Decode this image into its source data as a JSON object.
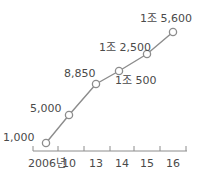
{
  "chart_data": {
    "type": "line",
    "title": "",
    "xlabel": "",
    "ylabel": "",
    "categories": [
      "2006년",
      "10",
      "13",
      "14",
      "15",
      "16"
    ],
    "values": [
      1000,
      5000,
      8850,
      10500,
      12500,
      15600
    ],
    "value_labels": [
      "1,000",
      "5,000",
      "8,850",
      "1조 500",
      "1조 2,500",
      "1조 5,600"
    ],
    "grid": false,
    "legend": null,
    "colors": {
      "line": "#8c8c8c",
      "marker_stroke": "#8c8c8c",
      "marker_fill": "#ffffff",
      "text": "#4a4a4a",
      "axis": "#8c8c8c"
    }
  },
  "layout": {
    "points": [
      {
        "x": 46,
        "y": 143
      },
      {
        "x": 69,
        "y": 115
      },
      {
        "x": 96,
        "y": 84
      },
      {
        "x": 119,
        "y": 71
      },
      {
        "x": 147,
        "y": 54
      },
      {
        "x": 173,
        "y": 32
      }
    ],
    "label_pos": [
      {
        "x": 3,
        "y": 141,
        "anchor": "start"
      },
      {
        "x": 30,
        "y": 112,
        "anchor": "start"
      },
      {
        "x": 64,
        "y": 77,
        "anchor": "start"
      },
      {
        "x": 115,
        "y": 84,
        "anchor": "start"
      },
      {
        "x": 99,
        "y": 51,
        "anchor": "start"
      },
      {
        "x": 140,
        "y": 22,
        "anchor": "start"
      }
    ],
    "axis_y": 151,
    "axis_x_start": 33,
    "axis_x_end": 187,
    "ticks": [
      33,
      58,
      84,
      110,
      134,
      160,
      186
    ],
    "tick_label_pos": [
      {
        "x": 28,
        "y": 167
      },
      {
        "x": 69,
        "y": 167
      },
      {
        "x": 96,
        "y": 167
      },
      {
        "x": 122,
        "y": 167
      },
      {
        "x": 147,
        "y": 167
      },
      {
        "x": 173,
        "y": 167
      }
    ]
  }
}
